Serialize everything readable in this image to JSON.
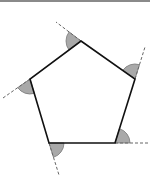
{
  "diagram": {
    "type": "pentagon-exterior-angles",
    "vertices": [
      {
        "id": "top",
        "x": 81,
        "y": 41
      },
      {
        "id": "right",
        "x": 135,
        "y": 79
      },
      {
        "id": "bottom-right",
        "x": 115,
        "y": 143
      },
      {
        "id": "bottom-left",
        "x": 49,
        "y": 143
      },
      {
        "id": "left",
        "x": 30,
        "y": 79
      }
    ],
    "extensions": [
      {
        "from": "top",
        "to": {
          "x": 56,
          "y": 22
        }
      },
      {
        "from": "right",
        "to": {
          "x": 145,
          "y": 47
        }
      },
      {
        "from": "bottom-right",
        "to": {
          "x": 149,
          "y": 143
        }
      },
      {
        "from": "bottom-left",
        "to": {
          "x": 59,
          "y": 175
        }
      },
      {
        "from": "left",
        "to": {
          "x": 3,
          "y": 98
        }
      }
    ],
    "colors": {
      "stroke": "#111111",
      "angle_fill": "#a9a9a9",
      "angle_stroke": "#777777",
      "dash": "#666666",
      "top_bar": "#8a8a8a"
    },
    "labels": []
  }
}
